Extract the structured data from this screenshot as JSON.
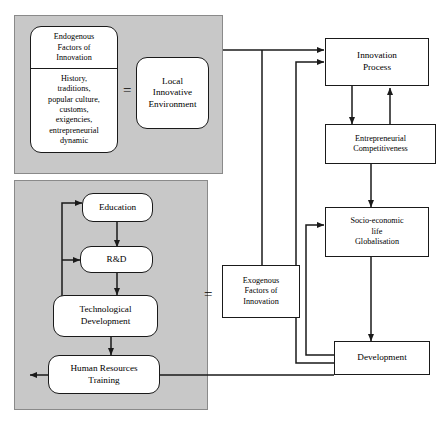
{
  "diagram": {
    "panels": {
      "top_left": {
        "name": "endogenous-panel"
      },
      "bottom_left": {
        "name": "education-panel"
      }
    },
    "equals_signs": [
      {
        "id": "eq-endogenous",
        "label": "="
      },
      {
        "id": "eq-exogenous",
        "label": "="
      }
    ],
    "nodes": {
      "endogenous_title": "Endogenous\nFactors of\nInnovation",
      "endogenous_title_lines": [
        "Endogenous",
        "Factors of",
        "Innovation"
      ],
      "endogenous_body_lines": [
        "History,",
        "traditions,",
        "popular culture,",
        "customs,",
        "exigencies,",
        "entrepreneurial",
        "dynamic"
      ],
      "local_environment_lines": [
        "Local",
        "Innovative",
        "Environment"
      ],
      "education": "Education",
      "rnd": "R&D",
      "technological_development_lines": [
        "Technological",
        "Development"
      ],
      "human_resources_lines": [
        "Human Resources",
        "Training"
      ],
      "exogenous_lines": [
        "Exogenous",
        "Factors of",
        "Innovation"
      ],
      "innovation_process_lines": [
        "Innovation",
        "Process"
      ],
      "entrepreneurial_lines": [
        "Entrepreneurial",
        "Competitiveness"
      ],
      "socio_economic_lines": [
        "Socio-economic",
        "life",
        "Globalisation"
      ],
      "development": "Development"
    },
    "colors": {
      "panel_fill": "#c8c8c8",
      "panel_stroke": "#8a8a8a",
      "box_fill": "#ffffff",
      "box_stroke": "#1a1a1a",
      "line": "#1a1a1a",
      "page": "#ffffff"
    }
  }
}
